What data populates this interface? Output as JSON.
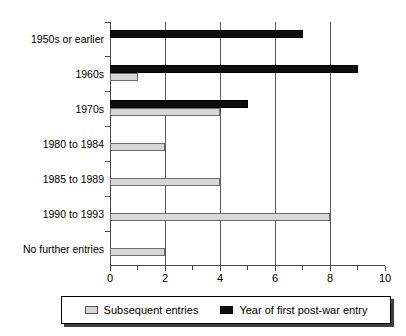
{
  "chart_data": {
    "type": "bar",
    "orientation": "horizontal",
    "title": "",
    "xlabel": "",
    "ylabel": "",
    "xlim": [
      0,
      10
    ],
    "xticks": [
      0,
      2,
      4,
      6,
      8,
      10
    ],
    "xtick_labels": [
      "0",
      "2",
      "4",
      "6",
      "8",
      "10"
    ],
    "minor_xticks": [
      1,
      3,
      5,
      7,
      9
    ],
    "grid": "vertical-major",
    "legend_position": "below",
    "categories": [
      "1950s or earlier",
      "1960s",
      "1970s",
      "1980 to 1984",
      "1985 to 1989",
      "1990 to 1993",
      "No further entries"
    ],
    "series": [
      {
        "name": "Year of first post-war entry",
        "color": "#0d0d0d",
        "values": [
          7,
          9,
          5,
          0,
          0,
          0,
          0
        ]
      },
      {
        "name": "Subsequent entries",
        "color": "#d7d7d7",
        "values": [
          0,
          1,
          4,
          2,
          4,
          8,
          2
        ]
      }
    ]
  },
  "legend": {
    "items": [
      {
        "label": "Subsequent entries",
        "swatch": "light-gray-square"
      },
      {
        "label": "Year of first post-war entry",
        "swatch": "black-square"
      }
    ]
  },
  "axis": {
    "x_tick_labels": [
      "0",
      "2",
      "4",
      "6",
      "8",
      "10"
    ]
  },
  "categories": [
    "1950s or earlier",
    "1960s",
    "1970s",
    "1980 to 1984",
    "1985 to 1989",
    "1990 to 1993",
    "No further entries"
  ]
}
